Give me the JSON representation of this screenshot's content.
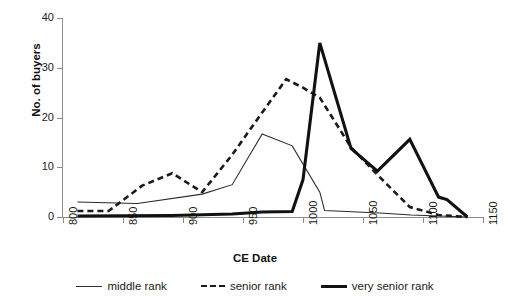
{
  "chart_data": {
    "type": "line",
    "title": "",
    "xlabel": "CE Date",
    "ylabel": "No. of buyers",
    "xlim": [
      800,
      1150
    ],
    "ylim": [
      0,
      40
    ],
    "xticks": [
      800,
      850,
      900,
      950,
      1000,
      1050,
      1100,
      1150
    ],
    "yticks": [
      0,
      10,
      20,
      30,
      40
    ],
    "xtick_labels": [
      "800",
      "850",
      "900",
      "950",
      "1000",
      "1050",
      "1100",
      "1150"
    ],
    "ytick_labels": [
      "0",
      "10",
      "20",
      "30",
      "40"
    ],
    "grid": false,
    "legend_position": "bottom",
    "series": [
      {
        "name": "middle rank",
        "style": "thin-solid",
        "color": "#2b2b2b",
        "points": [
          [
            812,
            3.0
          ],
          [
            862,
            2.7
          ],
          [
            916,
            4.6
          ],
          [
            941,
            6.5
          ],
          [
            966,
            16.7
          ],
          [
            991,
            14.3
          ],
          [
            1014,
            5.0
          ],
          [
            1018,
            1.3
          ],
          [
            1064,
            0.8
          ],
          [
            1090,
            0.4
          ],
          [
            1137,
            0.0
          ]
        ]
      },
      {
        "name": "senior rank",
        "style": "dashed",
        "color": "#1a1a1a",
        "points": [
          [
            812,
            1.2
          ],
          [
            838,
            1.2
          ],
          [
            866,
            6.3
          ],
          [
            891,
            8.8
          ],
          [
            916,
            5.0
          ],
          [
            941,
            12.5
          ],
          [
            963,
            20.0
          ],
          [
            986,
            27.7
          ],
          [
            1000,
            26.0
          ],
          [
            1014,
            24.0
          ],
          [
            1040,
            14.0
          ],
          [
            1064,
            8.0
          ],
          [
            1089,
            2.0
          ],
          [
            1113,
            0.4
          ],
          [
            1137,
            0.0
          ]
        ]
      },
      {
        "name": "very senior rank",
        "style": "thick-solid",
        "color": "#111111",
        "points": [
          [
            812,
            0.2
          ],
          [
            891,
            0.3
          ],
          [
            941,
            0.6
          ],
          [
            966,
            1.0
          ],
          [
            991,
            1.1
          ],
          [
            1000,
            7.5
          ],
          [
            1014,
            35.0
          ],
          [
            1040,
            13.8
          ],
          [
            1062,
            9.2
          ],
          [
            1089,
            15.6
          ],
          [
            1113,
            4.0
          ],
          [
            1120,
            3.5
          ],
          [
            1137,
            0.0
          ]
        ]
      }
    ]
  },
  "legend": {
    "items": [
      {
        "label": "middle rank",
        "style": "thin-solid"
      },
      {
        "label": "senior rank",
        "style": "dashed"
      },
      {
        "label": "very senior rank",
        "style": "thick-solid"
      }
    ]
  }
}
